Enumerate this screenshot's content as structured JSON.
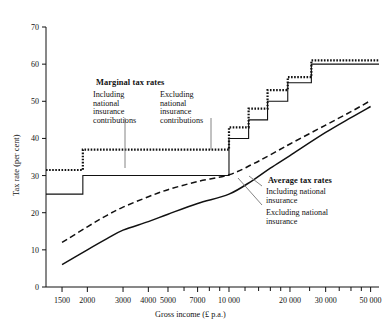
{
  "chart_data": {
    "type": "line",
    "title": "",
    "xlabel": "Gross income (£ p.a.)",
    "ylabel": "Tax rate (per cent)",
    "xscale": "log",
    "xlim": [
      1250,
      55000
    ],
    "ylim": [
      0,
      70
    ],
    "ytick_values": [
      0,
      10,
      20,
      30,
      40,
      50,
      60,
      70
    ],
    "ytick_labels": [
      "0",
      "10",
      "20",
      "30",
      "40",
      "50",
      "60",
      "70"
    ],
    "xtick_values": [
      1500,
      2000,
      3000,
      4000,
      5000,
      7000,
      10000,
      20000,
      30000,
      50000
    ],
    "xtick_labels": [
      "1500",
      "2000",
      "3000",
      "4000",
      "5000",
      "7000",
      "10 000",
      "20 000",
      "30 000",
      "50 000"
    ],
    "grid": false,
    "legend_position": "annotations-inline",
    "series": [
      {
        "name": "Marginal tax rate including national insurance contributions",
        "style": "step-dotted-thick",
        "steps": [
          {
            "x_start": 1250,
            "x_end": 1900,
            "y": 31.5
          },
          {
            "x_start": 1900,
            "x_end": 10000,
            "y": 37.0
          },
          {
            "x_start": 10000,
            "x_end": 12500,
            "y": 43.0
          },
          {
            "x_start": 12500,
            "x_end": 15500,
            "y": 48.0
          },
          {
            "x_start": 15500,
            "x_end": 19500,
            "y": 53.0
          },
          {
            "x_start": 19500,
            "x_end": 25500,
            "y": 56.5
          },
          {
            "x_start": 25500,
            "x_end": 55000,
            "y": 61.0
          }
        ]
      },
      {
        "name": "Marginal tax rate excluding national insurance contributions",
        "style": "step-solid",
        "steps": [
          {
            "x_start": 1250,
            "x_end": 1900,
            "y": 25.0
          },
          {
            "x_start": 1900,
            "x_end": 10000,
            "y": 30.0
          },
          {
            "x_start": 10000,
            "x_end": 12500,
            "y": 40.0
          },
          {
            "x_start": 12500,
            "x_end": 15500,
            "y": 45.0
          },
          {
            "x_start": 15500,
            "x_end": 19500,
            "y": 50.0
          },
          {
            "x_start": 19500,
            "x_end": 25500,
            "y": 55.0
          },
          {
            "x_start": 25500,
            "x_end": 55000,
            "y": 60.0
          }
        ]
      },
      {
        "name": "Average tax rate including national insurance",
        "style": "dashed",
        "points": [
          {
            "x": 1500,
            "y": 12.0
          },
          {
            "x": 2000,
            "y": 16.2
          },
          {
            "x": 2500,
            "y": 19.3
          },
          {
            "x": 3000,
            "y": 21.5
          },
          {
            "x": 4000,
            "y": 24.3
          },
          {
            "x": 5000,
            "y": 26.2
          },
          {
            "x": 7000,
            "y": 28.4
          },
          {
            "x": 10000,
            "y": 30.2
          },
          {
            "x": 13000,
            "y": 33.0
          },
          {
            "x": 16000,
            "y": 35.6
          },
          {
            "x": 20000,
            "y": 38.5
          },
          {
            "x": 30000,
            "y": 43.6
          },
          {
            "x": 40000,
            "y": 47.2
          },
          {
            "x": 50000,
            "y": 50.2
          }
        ]
      },
      {
        "name": "Average tax rate excluding national insurance",
        "style": "solid",
        "points": [
          {
            "x": 1500,
            "y": 6.0
          },
          {
            "x": 2000,
            "y": 10.0
          },
          {
            "x": 2500,
            "y": 13.0
          },
          {
            "x": 3000,
            "y": 15.3
          },
          {
            "x": 4000,
            "y": 17.6
          },
          {
            "x": 5000,
            "y": 19.6
          },
          {
            "x": 7000,
            "y": 22.5
          },
          {
            "x": 10000,
            "y": 25.0
          },
          {
            "x": 13000,
            "y": 28.6
          },
          {
            "x": 16000,
            "y": 32.0
          },
          {
            "x": 20000,
            "y": 35.4
          },
          {
            "x": 30000,
            "y": 41.6
          },
          {
            "x": 40000,
            "y": 45.6
          },
          {
            "x": 50000,
            "y": 48.6
          }
        ]
      }
    ],
    "annotations": [
      {
        "id": "marginal",
        "title": "Marginal tax rates",
        "left_label": "Including\nnational\ninsurance\ncontributions",
        "right_label": "Excluding\nnational\ninsurance\ncontributions"
      },
      {
        "id": "average",
        "title": "Average tax rates",
        "first_label": "Including national\ninsurance",
        "second_label": "Excluding national\ninsurance"
      }
    ]
  },
  "annotations": {
    "marginal_title": "Marginal tax rates",
    "marginal_including": [
      "Including",
      "national",
      "insurance",
      "contributions"
    ],
    "marginal_excluding": [
      "Excluding",
      "national",
      "insurance",
      "contributions"
    ],
    "average_title": "Average tax rates",
    "average_including": [
      "Including national",
      "insurance"
    ],
    "average_excluding": [
      "Excluding national",
      "insurance"
    ]
  },
  "axes": {
    "x_title": "Gross income (£ p.a.)",
    "y_title": "Tax rate (per cent)"
  },
  "colors": {
    "ink": "#111111",
    "background": "#ffffff"
  }
}
